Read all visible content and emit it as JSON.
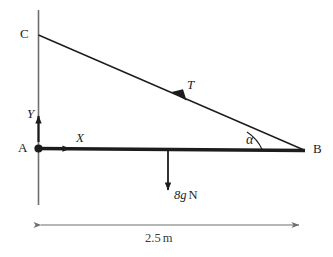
{
  "figure": {
    "background_color": "#ffffff",
    "stroke_color": "#1c1c1c",
    "light_stroke_color": "#6e6e6e",
    "width": 333,
    "height": 257
  },
  "vertices": {
    "a_label": "A",
    "b_label": "B",
    "c_label": "C"
  },
  "axes": {
    "x_label": "X",
    "y_label": "Y"
  },
  "forces": {
    "tension_label": "T",
    "weight_value": "8g",
    "weight_unit": "N"
  },
  "angle": {
    "symbol": "α"
  },
  "dimension": {
    "length_value": "2.5",
    "length_unit": "m"
  },
  "geometry": {
    "wall_x": 38,
    "wall_top_y": 10,
    "wall_bottom_y": 205,
    "point_a": [
      38,
      148
    ],
    "point_b": [
      304,
      150
    ],
    "point_c": [
      38,
      35
    ],
    "weight_x": 168,
    "weight_tip_y": 196,
    "dim_line_y": 225,
    "dim_left_x": 38,
    "dim_right_x": 302
  }
}
